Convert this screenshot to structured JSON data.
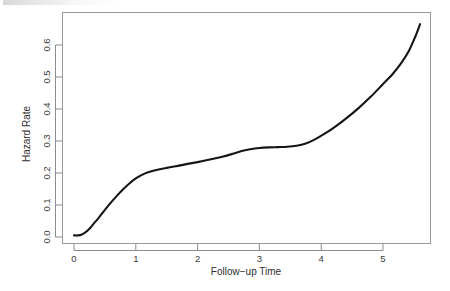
{
  "chart_data": {
    "type": "line",
    "title": "",
    "xlabel": "Follow−up Time",
    "ylabel": "Hazard Rate",
    "xlim": [
      -0.08,
      5.72
    ],
    "ylim": [
      -0.012,
      0.7
    ],
    "xticks": [
      0,
      1,
      2,
      3,
      4,
      5
    ],
    "xtick_labels": [
      "0",
      "1",
      "2",
      "3",
      "4",
      "5"
    ],
    "yticks": [
      0.0,
      0.1,
      0.2,
      0.3,
      0.4,
      0.5,
      0.6
    ],
    "ytick_labels": [
      "0.0",
      "0.1",
      "0.2",
      "0.3",
      "0.4",
      "0.5",
      "0.6"
    ],
    "grid": false,
    "legend": null,
    "series": [
      {
        "name": "Hazard Rate",
        "color": "#151515",
        "x": [
          0.0,
          0.06,
          0.12,
          0.18,
          0.25,
          0.32,
          0.4,
          0.5,
          0.6,
          0.7,
          0.8,
          0.9,
          1.0,
          1.1,
          1.2,
          1.35,
          1.5,
          1.65,
          1.8,
          2.0,
          2.2,
          2.4,
          2.55,
          2.7,
          2.85,
          3.0,
          3.15,
          3.3,
          3.45,
          3.6,
          3.75,
          3.9,
          4.05,
          4.2,
          4.4,
          4.6,
          4.8,
          5.0,
          5.15,
          5.3,
          5.42,
          5.52,
          5.6
        ],
        "y": [
          0.005,
          0.005,
          0.007,
          0.014,
          0.026,
          0.042,
          0.06,
          0.085,
          0.108,
          0.13,
          0.15,
          0.168,
          0.183,
          0.194,
          0.202,
          0.21,
          0.216,
          0.221,
          0.227,
          0.234,
          0.242,
          0.251,
          0.259,
          0.268,
          0.274,
          0.278,
          0.28,
          0.281,
          0.282,
          0.285,
          0.292,
          0.305,
          0.322,
          0.341,
          0.37,
          0.402,
          0.438,
          0.478,
          0.508,
          0.545,
          0.582,
          0.625,
          0.665
        ]
      }
    ]
  },
  "axes": {
    "y_title": "Hazard Rate",
    "x_title": "Follow−up Time"
  }
}
